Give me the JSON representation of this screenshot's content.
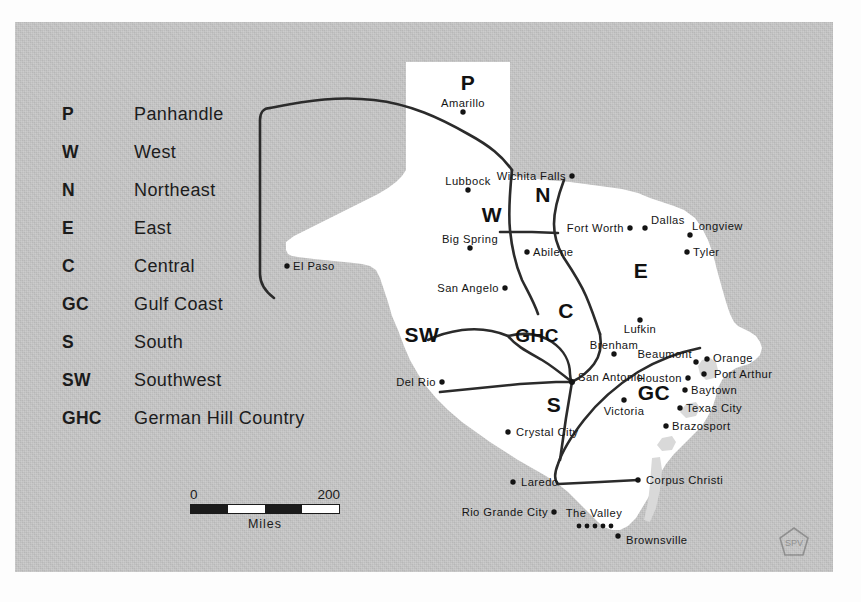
{
  "figure": {
    "background_color": "#bcbcbc",
    "land_color": "#ffffff",
    "line_color": "#2b2b2b"
  },
  "legend": {
    "items": [
      {
        "abbr": "P",
        "name": "Panhandle"
      },
      {
        "abbr": "W",
        "name": "West"
      },
      {
        "abbr": "N",
        "name": "Northeast"
      },
      {
        "abbr": "E",
        "name": "East"
      },
      {
        "abbr": "C",
        "name": "Central"
      },
      {
        "abbr": "GC",
        "name": "Gulf Coast"
      },
      {
        "abbr": "S",
        "name": "South"
      },
      {
        "abbr": "SW",
        "name": "Southwest"
      },
      {
        "abbr": "GHC",
        "name": "German Hill Country"
      }
    ]
  },
  "scale": {
    "min": "0",
    "max": "200",
    "units": "Miles"
  },
  "map": {
    "region_labels": [
      {
        "abbr": "P"
      },
      {
        "abbr": "W"
      },
      {
        "abbr": "N"
      },
      {
        "abbr": "E"
      },
      {
        "abbr": "C"
      },
      {
        "abbr": "GHC"
      },
      {
        "abbr": "GC"
      },
      {
        "abbr": "S"
      },
      {
        "abbr": "SW"
      }
    ],
    "cities": [
      {
        "name": "Amarillo"
      },
      {
        "name": "Lubbock"
      },
      {
        "name": "Wichita Falls"
      },
      {
        "name": "Fort Worth"
      },
      {
        "name": "Dallas"
      },
      {
        "name": "Longview"
      },
      {
        "name": "Tyler"
      },
      {
        "name": "Big Spring"
      },
      {
        "name": "Abilene"
      },
      {
        "name": "San Angelo"
      },
      {
        "name": "El Paso"
      },
      {
        "name": "Lufkin"
      },
      {
        "name": "Brenham"
      },
      {
        "name": "Beaumont"
      },
      {
        "name": "Orange"
      },
      {
        "name": "Port Arthur"
      },
      {
        "name": "Houston"
      },
      {
        "name": "Baytown"
      },
      {
        "name": "Texas City"
      },
      {
        "name": "Brazosport"
      },
      {
        "name": "Del Rio"
      },
      {
        "name": "San Antonio"
      },
      {
        "name": "Victoria"
      },
      {
        "name": "Crystal City"
      },
      {
        "name": "Laredo"
      },
      {
        "name": "Corpus Christi"
      },
      {
        "name": "Rio Grande City"
      },
      {
        "name": "The Valley"
      },
      {
        "name": "Brownsville"
      }
    ]
  },
  "credit": {
    "mark": "SPV"
  }
}
